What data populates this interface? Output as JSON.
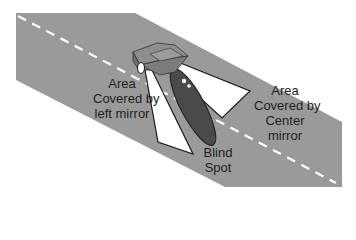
{
  "diagram": {
    "colors": {
      "road": "#9a9a9a",
      "lane_marking": "#ffffff",
      "car_body": "#7c7c7c",
      "car_top": "#8e8e8e",
      "coverage_area": "#ffffff",
      "blind_spot": "#4a4a4a",
      "outline": "#1a1a1a"
    },
    "labels": {
      "left_mirror": [
        "Area",
        "Covered by",
        "left mirror"
      ],
      "center_mirror": [
        "Area",
        "Covered by",
        "Center",
        "mirror"
      ],
      "blind_spot": [
        "Blind",
        "Spot"
      ]
    }
  }
}
